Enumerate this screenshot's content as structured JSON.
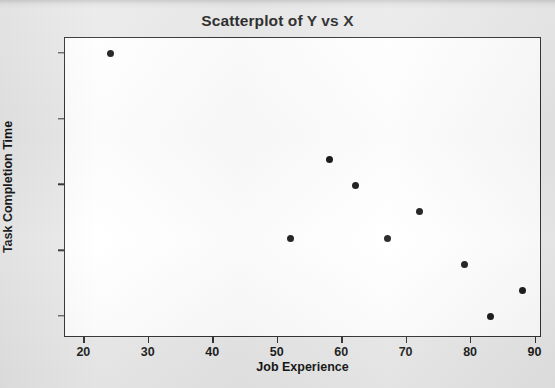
{
  "chart_data": {
    "type": "scatter",
    "title": "Scatterplot of Y vs X",
    "xlabel": "Job Experience",
    "ylabel": "Task Completion Time",
    "xlim": [
      17,
      91
    ],
    "ylim": [
      34.2,
      45.6
    ],
    "xticks": [
      20,
      30,
      40,
      50,
      60,
      70,
      80,
      90
    ],
    "xtick_labels": [
      "20",
      "30",
      "40",
      "50",
      "60",
      "70",
      "80",
      "90"
    ],
    "yticks": [
      35.0,
      37.5,
      40.0,
      42.5,
      45.0
    ],
    "ytick_labels": [
      "35.0",
      "37.5",
      "40.0",
      "42.5",
      "45.0"
    ],
    "grid": false,
    "legend": null,
    "marker": "filled-circle",
    "marker_color": "#101010",
    "x": [
      24,
      52,
      58,
      62,
      67,
      72,
      79,
      83,
      88
    ],
    "y": [
      45.0,
      38.0,
      41.0,
      40.0,
      38.0,
      39.0,
      37.0,
      35.0,
      36.0
    ],
    "points": [
      {
        "x": 24,
        "y": 45.0
      },
      {
        "x": 52,
        "y": 38.0
      },
      {
        "x": 58,
        "y": 41.0
      },
      {
        "x": 62,
        "y": 40.0
      },
      {
        "x": 67,
        "y": 38.0
      },
      {
        "x": 72,
        "y": 39.0
      },
      {
        "x": 79,
        "y": 37.0
      },
      {
        "x": 83,
        "y": 35.0
      },
      {
        "x": 88,
        "y": 36.0
      }
    ]
  },
  "figure": {
    "background_color": "#e9e9e9",
    "plot_area_color": "#ffffff",
    "axis_color": "#2b2b2b"
  }
}
